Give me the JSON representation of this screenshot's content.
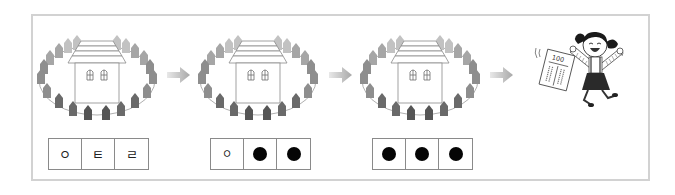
{
  "figure": {
    "colors": {
      "frame_border": "#d2d2d2",
      "fence_light": "#b8b8b8",
      "fence_mid": "#8c8c8c",
      "fence_dark": "#555555",
      "arrow": "#bdbdbd",
      "box_border": "#8a8a8a",
      "dot": "#050505"
    }
  },
  "steps": [
    {
      "scene": "house-with-fence",
      "cells": [
        {
          "type": "letter",
          "value": "ㅇ"
        },
        {
          "type": "letter",
          "value": "ㅌ"
        },
        {
          "type": "letter",
          "value": "ㄹ"
        }
      ]
    },
    {
      "scene": "house-with-fence",
      "cells": [
        {
          "type": "letter",
          "value": "ㅇ"
        },
        {
          "type": "dot",
          "value": "●"
        },
        {
          "type": "dot",
          "value": "●"
        }
      ]
    },
    {
      "scene": "house-with-fence",
      "cells": [
        {
          "type": "dot",
          "value": "●"
        },
        {
          "type": "dot",
          "value": "●"
        },
        {
          "type": "dot",
          "value": "●"
        }
      ]
    }
  ],
  "arrows": [
    "arrow-right-icon",
    "arrow-right-icon",
    "arrow-right-icon"
  ],
  "final": {
    "character": "happy-girl-jumping",
    "paper_score": "100"
  }
}
